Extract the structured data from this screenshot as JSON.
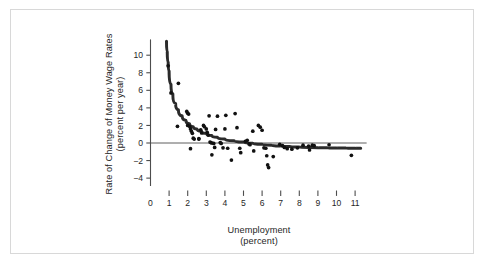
{
  "figure": {
    "background_color": "#ffffff",
    "frame_color": "#d8d8d8",
    "marker_color": "#111111",
    "curve_color": "#2b2b2b",
    "axis_color": "#4d4d4d",
    "text_color": "#262626"
  },
  "chart_data": {
    "type": "scatter",
    "title": "",
    "subtitle": "",
    "xlabel": "Unemployment",
    "xlabel_units": "(percent)",
    "ylabel": "Rate of Change of Money Wage Rates",
    "ylabel_units": "(percent per year)",
    "xlim": [
      0,
      11.6
    ],
    "ylim": [
      -5.2,
      11.9
    ],
    "xticks": [
      0,
      1,
      2,
      3,
      4,
      5,
      6,
      7,
      8,
      9,
      10,
      11
    ],
    "xtick_labels": [
      "0",
      "1",
      "2",
      "3",
      "4",
      "5",
      "6",
      "7",
      "8",
      "9",
      "10",
      "11"
    ],
    "yticks": [
      -4,
      -2,
      0,
      2,
      4,
      6,
      8,
      10
    ],
    "ytick_labels": [
      "−4",
      "−2",
      "0",
      "2",
      "4",
      "6",
      "8",
      "10"
    ],
    "grid": false,
    "legend": null,
    "zero_line": {
      "value": 0,
      "orientation": "horizontal",
      "label": "zero-reference-line"
    },
    "points": [
      [
        0.95,
        8.8
      ],
      [
        1.1,
        5.7
      ],
      [
        1.5,
        6.8
      ],
      [
        1.45,
        1.9
      ],
      [
        1.95,
        3.6
      ],
      [
        2.0,
        3.4
      ],
      [
        2.05,
        3.3
      ],
      [
        2.0,
        2.0
      ],
      [
        2.1,
        1.9
      ],
      [
        2.15,
        1.6
      ],
      [
        2.2,
        1.35
      ],
      [
        2.25,
        1.1
      ],
      [
        2.3,
        0.55
      ],
      [
        2.35,
        0.45
      ],
      [
        2.6,
        0.5
      ],
      [
        2.6,
        0.45
      ],
      [
        2.15,
        -0.65
      ],
      [
        2.7,
        1.5
      ],
      [
        2.75,
        1.15
      ],
      [
        2.85,
        2.0
      ],
      [
        2.9,
        1.85
      ],
      [
        3.0,
        1.6
      ],
      [
        3.05,
        1.2
      ],
      [
        3.1,
        0.9
      ],
      [
        3.15,
        3.1
      ],
      [
        3.2,
        0.1
      ],
      [
        3.25,
        0.05
      ],
      [
        3.3,
        0.0
      ],
      [
        3.4,
        -0.05
      ],
      [
        3.45,
        -0.5
      ],
      [
        3.3,
        -1.35
      ],
      [
        3.5,
        1.55
      ],
      [
        3.6,
        3.05
      ],
      [
        3.75,
        0.05
      ],
      [
        3.8,
        -0.05
      ],
      [
        3.9,
        -0.55
      ],
      [
        4.0,
        1.6
      ],
      [
        4.05,
        3.15
      ],
      [
        4.15,
        -0.6
      ],
      [
        4.35,
        -1.95
      ],
      [
        4.55,
        3.35
      ],
      [
        4.65,
        1.75
      ],
      [
        4.8,
        -0.6
      ],
      [
        4.85,
        -1.1
      ],
      [
        5.1,
        0.2
      ],
      [
        5.2,
        0.3
      ],
      [
        5.3,
        -0.1
      ],
      [
        5.35,
        -0.2
      ],
      [
        5.5,
        1.35
      ],
      [
        5.55,
        -0.9
      ],
      [
        5.8,
        2.0
      ],
      [
        5.9,
        1.8
      ],
      [
        6.0,
        1.45
      ],
      [
        6.1,
        -0.55
      ],
      [
        6.2,
        -0.6
      ],
      [
        6.25,
        -1.45
      ],
      [
        6.3,
        -2.5
      ],
      [
        6.35,
        -2.8
      ],
      [
        6.6,
        -1.55
      ],
      [
        6.95,
        -0.15
      ],
      [
        7.1,
        -0.3
      ],
      [
        7.2,
        -0.5
      ],
      [
        7.35,
        -0.65
      ],
      [
        7.6,
        -0.7
      ],
      [
        7.9,
        -0.55
      ],
      [
        8.2,
        -0.25
      ],
      [
        8.5,
        -0.35
      ],
      [
        8.55,
        -0.8
      ],
      [
        8.7,
        -0.25
      ],
      [
        8.8,
        -0.3
      ],
      [
        9.6,
        -0.2
      ],
      [
        10.8,
        -1.4
      ]
    ],
    "fitted_curve": {
      "name": "phillips-curve-fit",
      "description": "downward sloping convex curve asymptotic to about -0.6",
      "points": [
        [
          0.86,
          11.6
        ],
        [
          0.9,
          10.4
        ],
        [
          0.95,
          9.2
        ],
        [
          1.0,
          8.2
        ],
        [
          1.1,
          6.7
        ],
        [
          1.2,
          5.6
        ],
        [
          1.35,
          4.5
        ],
        [
          1.5,
          3.8
        ],
        [
          1.7,
          3.1
        ],
        [
          1.9,
          2.6
        ],
        [
          2.1,
          2.2
        ],
        [
          2.3,
          1.85
        ],
        [
          2.5,
          1.6
        ],
        [
          2.75,
          1.35
        ],
        [
          3.0,
          1.1
        ],
        [
          3.3,
          0.85
        ],
        [
          3.6,
          0.65
        ],
        [
          4.0,
          0.45
        ],
        [
          4.5,
          0.25
        ],
        [
          5.0,
          0.1
        ],
        [
          5.5,
          -0.02
        ],
        [
          6.0,
          -0.14
        ],
        [
          6.5,
          -0.25
        ],
        [
          7.0,
          -0.34
        ],
        [
          7.5,
          -0.41
        ],
        [
          8.0,
          -0.46
        ],
        [
          8.5,
          -0.5
        ],
        [
          9.0,
          -0.53
        ],
        [
          9.5,
          -0.55
        ],
        [
          10.0,
          -0.57
        ],
        [
          10.5,
          -0.58
        ],
        [
          11.0,
          -0.59
        ],
        [
          11.3,
          -0.6
        ]
      ]
    }
  }
}
